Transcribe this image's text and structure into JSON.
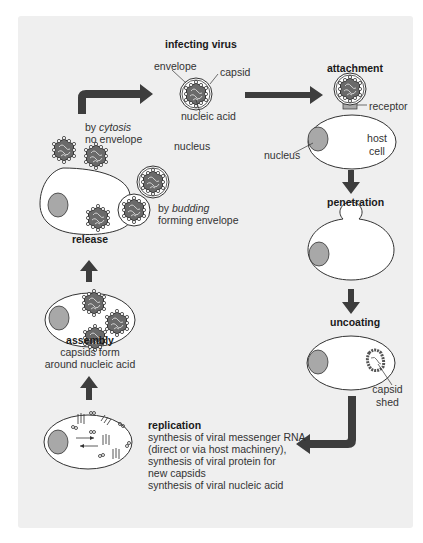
{
  "stages": {
    "infecting_virus": {
      "label": "infecting virus",
      "parts": {
        "envelope": "envelope",
        "capsid": "capsid",
        "nucleic_acid": "nucleic acid"
      }
    },
    "attachment": {
      "label": "attachment",
      "receptor": "receptor",
      "host_cell": [
        "host",
        "cell"
      ],
      "nucleus": "nucleus"
    },
    "penetration": {
      "label": "penetration"
    },
    "uncoating": {
      "label": "uncoating",
      "capsid_shed": [
        "capsid",
        "shed"
      ]
    },
    "replication": {
      "label": "replication",
      "lines": [
        "synthesis of viral messenger RNA",
        "(direct or via host machinery),",
        "synthesis of viral protein for",
        "new capsids",
        "synthesis of viral nucleic acid"
      ]
    },
    "assembly": {
      "label": "assembly",
      "lines": [
        "capsids form",
        "around nucleic acid"
      ]
    },
    "release": {
      "label": "release",
      "cytosis": {
        "prefix": "by ",
        "italic": "cytosis",
        "line2": "no envelope"
      },
      "budding": {
        "prefix": "by ",
        "italic": "budding",
        "line2": "forming envelope"
      }
    },
    "nucleus_floating_label": "nucleus"
  },
  "colors": {
    "panel_bg": "#efefef",
    "arrow": "#3d3d3d",
    "cell_fill": "#ffffff",
    "nucleus_fill": "#a8a8a8",
    "virus_dark": "#555555"
  }
}
